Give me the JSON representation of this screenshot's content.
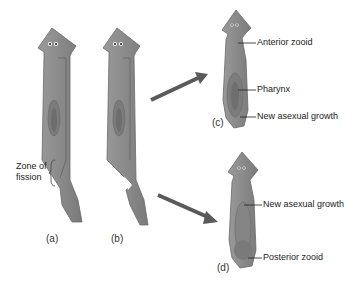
{
  "figure": {
    "colors": {
      "body": "#8e8e8e",
      "body_dark": "#6f6f6f",
      "body_light": "#a8a8a8",
      "arrow": "#5a5a5a",
      "text": "#222222"
    }
  },
  "panels": {
    "a": {
      "label": "(a)"
    },
    "b": {
      "label": "(b)"
    },
    "c": {
      "label": "(c)"
    },
    "d": {
      "label": "(d)"
    }
  },
  "annotations": {
    "zone_of_fission_line1": "Zone of",
    "zone_of_fission_line2": "fission",
    "anterior_zooid": "Anterior zooid",
    "pharynx": "Pharynx",
    "new_growth_c": "New asexual growth",
    "new_growth_d": "New asexual growth",
    "posterior_zooid": "Posterior zooid"
  }
}
